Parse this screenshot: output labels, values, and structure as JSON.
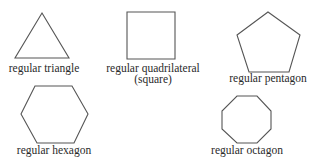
{
  "colors": {
    "background": "#ffffff",
    "stroke": "#555555",
    "text": "#2a2a2a"
  },
  "shapes": [
    {
      "name": "triangle",
      "sides": 3,
      "label": "regular triangle",
      "points": "42,13 69,58 15,58"
    },
    {
      "name": "square",
      "sides": 4,
      "label": "regular quadrilateral",
      "sublabel": "(square)",
      "points": "127,12 175,12 175,59 127,59"
    },
    {
      "name": "pentagon",
      "sides": 5,
      "label": "regular pentagon",
      "points": "268,12 300,35 289,72 249,72 237,35"
    },
    {
      "name": "hexagon",
      "sides": 6,
      "label": "regular hexagon",
      "points": "35,86 72,86 88,114 74,143 37,143 21,114"
    },
    {
      "name": "octagon",
      "sides": 8,
      "label": "regular octagon",
      "points": "237,96 257,96 271,111 271,129 257,143 237,143 222,129 222,111"
    }
  ]
}
